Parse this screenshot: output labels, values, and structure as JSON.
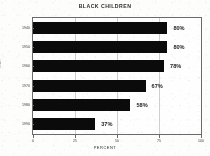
{
  "chart_data": {
    "type": "bar",
    "orientation": "horizontal",
    "title": "BLACK CHILDREN",
    "xlabel": "PERCENT",
    "ylabel": "YEAR",
    "categories": [
      "1940",
      "1950",
      "1960",
      "1970",
      "1980",
      "1990"
    ],
    "values": [
      80,
      80,
      78,
      67,
      58,
      37
    ],
    "value_labels": [
      "80%",
      "80%",
      "78%",
      "67%",
      "58%",
      "37%"
    ],
    "xlim": [
      0,
      100
    ],
    "xticks": [
      0,
      25,
      50,
      75,
      100
    ],
    "xtick_labels": [
      "0",
      "25",
      "50",
      "75",
      "100"
    ],
    "grid": true,
    "legend": null,
    "bar_color": "#0b0b0b",
    "frame_color": "#6a6a6a",
    "background_color": "#fdfdfc"
  }
}
